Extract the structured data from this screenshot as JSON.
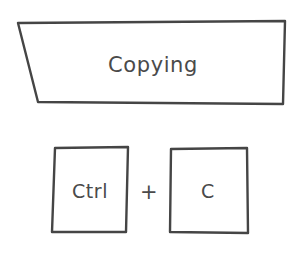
{
  "canvas": {
    "width": 300,
    "height": 261,
    "background_color": "#ffffff",
    "stroke_color": "#454545",
    "text_color": "#4a4a4a",
    "style": "hand-drawn-sketch"
  },
  "banner": {
    "label": "Copying",
    "shape": "trapezoid",
    "points": "18,23 285,21 283,104 38,102",
    "label_x": 153,
    "label_y": 66
  },
  "shortcut": {
    "separator": "+",
    "separator_x": 149,
    "separator_y": 193,
    "keys": [
      {
        "label": "Ctrl",
        "shape": "quadrilateral",
        "points": "55,148 128,147 126,232 52,232",
        "label_x": 90,
        "label_y": 192
      },
      {
        "label": "C",
        "shape": "quadrilateral",
        "points": "171,149 247,148 248,233 170,232",
        "label_x": 208,
        "label_y": 192
      }
    ]
  }
}
